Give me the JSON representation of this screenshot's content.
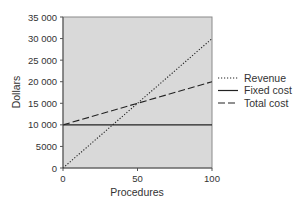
{
  "chart_data": {
    "type": "line",
    "title": "",
    "xlabel": "Procedures",
    "ylabel": "Dollars",
    "x": [
      0,
      50,
      100
    ],
    "xlim": [
      0,
      100
    ],
    "ylim": [
      0,
      35000
    ],
    "xticks": [
      "0",
      "50",
      "100"
    ],
    "yticks": [
      "0",
      "5000",
      "10 000",
      "15 000",
      "20 000",
      "25 000",
      "30 000",
      "35 000"
    ],
    "grid": false,
    "legend_position": "right",
    "series": [
      {
        "name": "Revenue",
        "style": "dotted",
        "values": [
          0,
          15000,
          30000
        ]
      },
      {
        "name": "Fixed cost",
        "style": "solid",
        "values": [
          10000,
          10000,
          10000
        ]
      },
      {
        "name": "Total cost",
        "style": "dashed",
        "values": [
          10000,
          15000,
          20000
        ]
      }
    ],
    "plot_background": "#d9d9d9"
  }
}
